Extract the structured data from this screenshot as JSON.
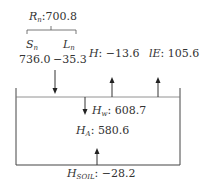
{
  "diagram": {
    "net_radiation": {
      "symbol": "R",
      "sub": "n",
      "value": "700.8"
    },
    "shortwave": {
      "symbol": "S",
      "sub": "n",
      "value": "736.0"
    },
    "longwave": {
      "symbol": "L",
      "sub": "n",
      "value": "−35.3"
    },
    "sensible_heat": {
      "symbol": "H",
      "value": "−13.6"
    },
    "latent_heat": {
      "symbol": "lE",
      "value": "105.6"
    },
    "water_heat": {
      "symbol": "H",
      "sub": "w",
      "value": "608.7"
    },
    "advected_heat": {
      "symbol": "H",
      "sub": "A",
      "value": "580.6"
    },
    "soil_heat": {
      "symbol": "H",
      "sub": "SOIL",
      "value": "−28.2"
    },
    "separator": ":"
  },
  "colors": {
    "line": "#444444",
    "text": "#333333"
  }
}
